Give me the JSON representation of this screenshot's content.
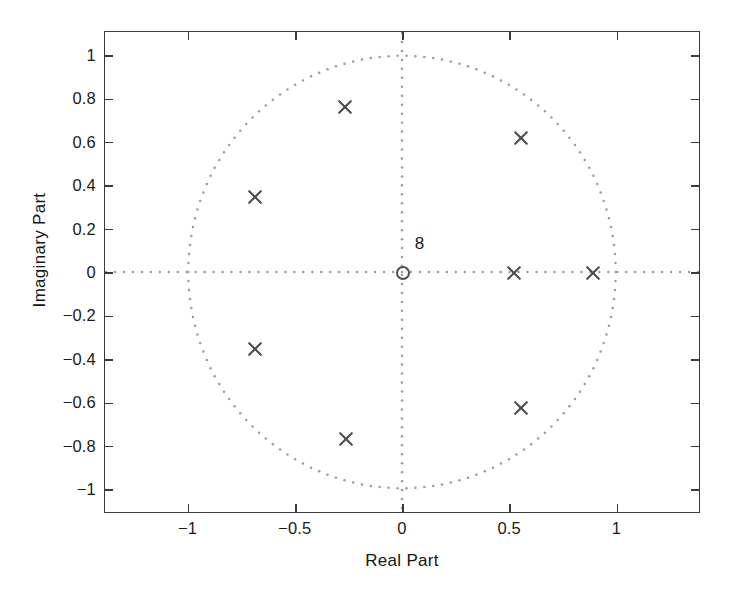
{
  "figure": {
    "background": "#ffffff",
    "axis_color": "#3a3a3a",
    "marker_color": "#4d4d4d",
    "grid_color": "#9a9a9a"
  },
  "chart_data": {
    "type": "scatter",
    "title": "",
    "xlabel": "Real Part",
    "ylabel": "Imaginary Part",
    "xlim": [
      -1.39,
      1.39
    ],
    "ylim": [
      -1.11,
      1.11
    ],
    "xticks": [
      -1,
      -0.5,
      0,
      0.5,
      1
    ],
    "xticklabels": [
      "−1",
      "−0.5",
      "0",
      "0.5",
      "1"
    ],
    "yticks": [
      1,
      0.8,
      0.6,
      0.4,
      0.2,
      0,
      -0.2,
      -0.4,
      -0.6,
      -0.8,
      -1
    ],
    "yticklabels": [
      "1",
      "0.8",
      "0.6",
      "0.4",
      "0.2",
      "0",
      "−0.2",
      "−0.4",
      "−0.6",
      "−0.8",
      "−1"
    ],
    "grid": false,
    "legend": null,
    "annotations": [
      {
        "text": "8",
        "x": 0.055,
        "y": 0.14,
        "meaning": "zero-multiplicity"
      }
    ],
    "reference_curves": [
      {
        "name": "unit-circle",
        "type": "circle",
        "center": [
          0,
          0
        ],
        "radius": 1,
        "style": "dotted"
      },
      {
        "name": "real-axis",
        "type": "hline",
        "y": 0,
        "style": "dotted"
      },
      {
        "name": "imag-axis",
        "type": "vline",
        "x": 0,
        "style": "dotted"
      }
    ],
    "series": [
      {
        "name": "poles",
        "marker": "x",
        "count": 8,
        "points": [
          {
            "x": -0.27,
            "y": 0.765
          },
          {
            "x": 0.55,
            "y": 0.62
          },
          {
            "x": -0.69,
            "y": 0.35
          },
          {
            "x": 0.52,
            "y": 0.0
          },
          {
            "x": 0.885,
            "y": 0.0
          },
          {
            "x": -0.69,
            "y": -0.35
          },
          {
            "x": 0.55,
            "y": -0.62
          },
          {
            "x": -0.265,
            "y": -0.765
          }
        ]
      },
      {
        "name": "zeros",
        "marker": "o",
        "count": 8,
        "points": [
          {
            "x": 0.0,
            "y": 0.0,
            "multiplicity": 8
          }
        ]
      }
    ]
  }
}
